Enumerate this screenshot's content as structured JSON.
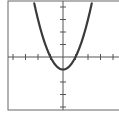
{
  "chart_data": {
    "type": "line",
    "title": "",
    "xlabel": "",
    "ylabel": "",
    "function": "y = x^2 - 1",
    "xlim": [
      -4.4,
      4.4
    ],
    "ylim": [
      -4.3,
      4.5
    ],
    "grid": false,
    "legend": null,
    "x_ticks": [
      -4,
      -3,
      -2,
      -1,
      1,
      2,
      3,
      4
    ],
    "y_ticks": [
      -4,
      -3,
      -2,
      -1,
      1,
      2,
      3,
      4
    ],
    "tick_labels_shown": false,
    "vertex": [
      0,
      -1
    ],
    "roots": [
      -1,
      1
    ],
    "x": [
      -2.25,
      -2,
      -1.5,
      -1,
      -0.5,
      0,
      0.5,
      1,
      1.5,
      2,
      2.25
    ],
    "values": [
      4.06,
      3,
      1.25,
      0,
      -0.75,
      -1,
      -0.75,
      0,
      1.25,
      3,
      4.06
    ],
    "colors": {
      "curve": "#3a3a3a",
      "axes": "#555555",
      "frame": "#666666"
    }
  }
}
